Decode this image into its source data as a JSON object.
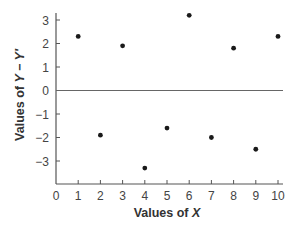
{
  "chart_data": {
    "type": "scatter",
    "title": "",
    "xlabel": "Values of X",
    "ylabel": "Values of Y − Y′",
    "xlabel_parts": {
      "prefix": "Values of ",
      "var": "X"
    },
    "ylabel_parts": {
      "prefix": "Values of ",
      "var": "Y − Y′"
    },
    "xlim": [
      0,
      10
    ],
    "ylim": [
      -4,
      3.5
    ],
    "x_ticks": [
      0,
      1,
      2,
      3,
      4,
      5,
      6,
      7,
      8,
      9,
      10
    ],
    "y_ticks": [
      3,
      2,
      1,
      0,
      -1,
      -2,
      -3
    ],
    "y_tick_labels": [
      "3",
      "2",
      "1",
      "0",
      "−1",
      "−2",
      "−3"
    ],
    "reference_line": {
      "y": 0
    },
    "grid": false,
    "legend": null,
    "series": [
      {
        "name": "residuals",
        "x": [
          1,
          2,
          3,
          4,
          5,
          6,
          7,
          8,
          9,
          10
        ],
        "y": [
          2.3,
          -1.9,
          1.9,
          -3.3,
          -1.6,
          3.2,
          -2.0,
          1.8,
          -2.5,
          2.3
        ]
      }
    ],
    "colors": {
      "points": "#1a1a1a",
      "axis": "#555555",
      "text": "#444444"
    }
  }
}
